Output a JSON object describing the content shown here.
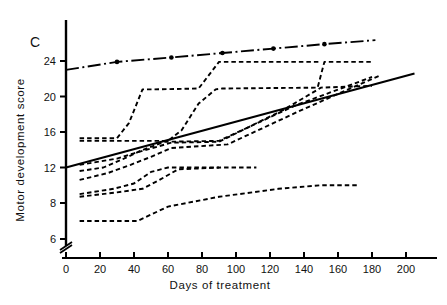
{
  "figure": {
    "panel_label": "C",
    "background": "#ffffff",
    "ink": "#000000"
  },
  "chart_data": {
    "type": "line",
    "title": "",
    "xlabel": "Days of treatment",
    "ylabel": "Motor development score",
    "xlim": [
      0,
      210
    ],
    "ylim": [
      5.2,
      26.5
    ],
    "grid": false,
    "legend": false,
    "y_axis_break": true,
    "y_axis_break_note": "axis broken below 6",
    "xticks": [
      0,
      20,
      40,
      60,
      80,
      100,
      120,
      140,
      160,
      180,
      200
    ],
    "xtick_labels": [
      "0",
      "20",
      "40",
      "60",
      "80",
      "100",
      "120",
      "140",
      "160",
      "180",
      "200"
    ],
    "yticks": [
      6,
      8,
      12,
      16,
      20,
      24
    ],
    "ytick_labels": [
      "6",
      "8",
      "12",
      "16",
      "20",
      "24"
    ],
    "series": [
      {
        "name": "reference-line-top",
        "style": "dash-dot",
        "markers": "dot",
        "x": [
          0,
          30,
          62,
          92,
          122,
          152,
          182
        ],
        "y": [
          23.0,
          23.9,
          24.4,
          24.9,
          25.4,
          25.9,
          26.35
        ],
        "marker_x": [
          30,
          62,
          92,
          122,
          152
        ],
        "marker_y": [
          23.9,
          24.4,
          24.9,
          25.4,
          25.9
        ]
      },
      {
        "name": "regression-line-solid",
        "style": "solid",
        "markers": "none",
        "x": [
          0,
          205
        ],
        "y": [
          12.0,
          22.6
        ]
      },
      {
        "name": "patient-1",
        "style": "dashed",
        "markers": "none",
        "x": [
          8,
          30,
          37,
          45,
          52,
          78,
          90,
          150
        ],
        "y": [
          15.3,
          15.3,
          17.0,
          20.8,
          20.8,
          20.9,
          23.9,
          23.9
        ]
      },
      {
        "name": "patient-2",
        "style": "dashed",
        "markers": "none",
        "x": [
          8,
          60,
          68,
          78,
          88,
          92,
          148,
          152,
          180
        ],
        "y": [
          15.0,
          15.0,
          16.2,
          19.2,
          20.8,
          20.9,
          21.0,
          23.9,
          23.9
        ]
      },
      {
        "name": "patient-3",
        "style": "dashed",
        "markers": "none",
        "x": [
          8,
          30,
          40,
          62,
          90,
          128,
          150,
          180
        ],
        "y": [
          12.3,
          13.0,
          13.6,
          14.8,
          14.9,
          18.5,
          21.0,
          21.2
        ]
      },
      {
        "name": "patient-4",
        "style": "dashed",
        "markers": "none",
        "x": [
          8,
          22,
          33,
          44,
          58,
          90,
          135,
          180
        ],
        "y": [
          11.6,
          12.0,
          12.9,
          13.9,
          14.9,
          15.0,
          19.0,
          22.2
        ]
      },
      {
        "name": "patient-5",
        "style": "dashed",
        "markers": "none",
        "x": [
          8,
          25,
          38,
          50,
          62,
          95,
          140,
          185
        ],
        "y": [
          10.6,
          11.4,
          12.3,
          13.2,
          14.2,
          14.6,
          18.6,
          22.4
        ]
      },
      {
        "name": "patient-6",
        "style": "dashed",
        "markers": "none",
        "x": [
          8,
          28,
          40,
          50,
          60,
          90
        ],
        "y": [
          9.0,
          9.6,
          10.2,
          11.5,
          12.0,
          12.0
        ]
      },
      {
        "name": "patient-7",
        "style": "dashed",
        "markers": "none",
        "x": [
          8,
          30,
          45,
          55,
          66,
          92,
          112
        ],
        "y": [
          8.7,
          9.2,
          9.6,
          10.6,
          11.8,
          12.0,
          12.0
        ]
      },
      {
        "name": "patient-8",
        "style": "dashed",
        "markers": "none",
        "x": [
          8,
          42,
          60,
          90,
          125,
          150,
          172
        ],
        "y": [
          7.0,
          7.0,
          7.8,
          8.7,
          9.6,
          10.0,
          10.0
        ]
      }
    ]
  }
}
